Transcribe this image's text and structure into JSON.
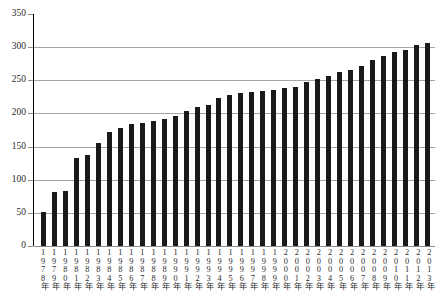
{
  "chart_data": {
    "type": "bar",
    "title": "",
    "subtitle": "",
    "xlabel": "",
    "ylabel": "",
    "ylim": [
      0,
      350
    ],
    "ytick_step": 50,
    "yticks": [
      "0",
      "50",
      "100",
      "150",
      "200",
      "250",
      "300",
      "350"
    ],
    "grid": true,
    "legend": "none",
    "bar_color": "#1a1a1a",
    "grid_color": "#a6a6a6",
    "categories": [
      "1978年",
      "1979年",
      "1980年",
      "1981年",
      "1982年",
      "1983年",
      "1984年",
      "1985年",
      "1986年",
      "1987年",
      "1988年",
      "1989年",
      "1990年",
      "1991年",
      "1992年",
      "1993年",
      "1994年",
      "1995年",
      "1996年",
      "1997年",
      "1998年",
      "1999年",
      "2000年",
      "2001年",
      "2002年",
      "2003年",
      "2004年",
      "2005年",
      "2006年",
      "2007年",
      "2008年",
      "2009年",
      "2010年",
      "2011年",
      "2012年",
      "2013年"
    ],
    "values": [
      52,
      81,
      83,
      133,
      137,
      155,
      172,
      178,
      184,
      186,
      189,
      191,
      196,
      203,
      209,
      212,
      224,
      228,
      231,
      233,
      234,
      235,
      238,
      240,
      248,
      252,
      256,
      262,
      265,
      272,
      281,
      286,
      292,
      296,
      303,
      307
    ]
  }
}
